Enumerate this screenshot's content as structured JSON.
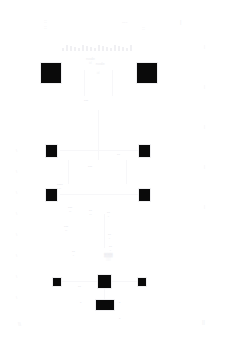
{
  "document": {
    "title": "Node Diagram",
    "background_color": "#ffffff",
    "node_color": "#0a0a0a",
    "faint_text_color": "#f0f0f3",
    "width": 246,
    "height": 340
  },
  "header": {
    "top_left_mark": "::\n::",
    "top_mid_mark": "---",
    "top_right_mark": "::",
    "far_right_mark": "|",
    "tick_count": 18,
    "caption": "node",
    "caption_sub": "id"
  },
  "rails": {
    "left_marks": [
      "\\",
      "\\",
      "\\",
      "\\",
      "\\",
      "\\",
      "\\",
      "\\"
    ],
    "right_marks": [
      "|",
      "|",
      "|",
      "|",
      "|"
    ]
  },
  "nodes": [
    {
      "id": "n1",
      "label": "",
      "sublabel": "",
      "x": 40,
      "y": 62,
      "w": 20,
      "h": 20,
      "size": "lg"
    },
    {
      "id": "n2",
      "label": "",
      "sublabel": "",
      "x": 136,
      "y": 62,
      "w": 20,
      "h": 20,
      "size": "lg"
    },
    {
      "id": "n3",
      "label": "",
      "sublabel": "",
      "x": 45,
      "y": 144,
      "w": 11,
      "h": 12,
      "size": "md"
    },
    {
      "id": "n4",
      "label": "",
      "sublabel": "",
      "x": 138,
      "y": 144,
      "w": 11,
      "h": 12,
      "size": "md"
    },
    {
      "id": "n5",
      "label": "",
      "sublabel": "",
      "x": 45,
      "y": 188,
      "w": 11,
      "h": 12,
      "size": "md"
    },
    {
      "id": "n6",
      "label": "",
      "sublabel": "",
      "x": 138,
      "y": 188,
      "w": 11,
      "h": 12,
      "size": "md"
    },
    {
      "id": "n7",
      "label": "",
      "sublabel": "",
      "x": 52,
      "y": 277,
      "w": 8,
      "h": 8,
      "size": "sm"
    },
    {
      "id": "n8",
      "label": "",
      "sublabel": "",
      "x": 97,
      "y": 274,
      "w": 13,
      "h": 13,
      "size": "md"
    },
    {
      "id": "n9",
      "label": "",
      "sublabel": "",
      "x": 137,
      "y": 277,
      "w": 8,
      "h": 8,
      "size": "sm"
    },
    {
      "id": "n10",
      "label": "",
      "sublabel": "",
      "x": 95,
      "y": 299,
      "w": 18,
      "h": 10,
      "size": "wide"
    }
  ],
  "labels": [
    {
      "id": "l_top",
      "text": "node",
      "sub": "id",
      "x": 86,
      "y": 56
    },
    {
      "id": "l_c1",
      "text": "•••",
      "sub": "",
      "x": 84,
      "y": 98
    },
    {
      "id": "l_c2",
      "text": "•••",
      "sub": "",
      "x": 88,
      "y": 164
    },
    {
      "id": "l_c3",
      "text": "••",
      "sub": "",
      "x": 117,
      "y": 152
    },
    {
      "id": "l_l1",
      "text": "••••",
      "sub": "••",
      "x": 57,
      "y": 182
    },
    {
      "id": "l_l2",
      "text": "•••",
      "sub": "••",
      "x": 68,
      "y": 205
    },
    {
      "id": "l_l3",
      "text": "•••",
      "sub": "••",
      "x": 64,
      "y": 224
    },
    {
      "id": "l_m1",
      "text": "••",
      "sub": "••",
      "x": 89,
      "y": 208
    },
    {
      "id": "l_m2",
      "text": "••",
      "sub": "•",
      "x": 107,
      "y": 210
    },
    {
      "id": "l_b1",
      "text": "••",
      "sub": "•",
      "x": 108,
      "y": 232
    },
    {
      "id": "l_b2",
      "text": "••",
      "sub": "•",
      "x": 109,
      "y": 244
    },
    {
      "id": "l_b3",
      "text": "••",
      "sub": "•",
      "x": 72,
      "y": 249
    },
    {
      "id": "l_b4",
      "text": "••",
      "sub": "",
      "x": 78,
      "y": 284
    },
    {
      "id": "l_b5",
      "text": "•",
      "sub": "",
      "x": 119,
      "y": 300
    },
    {
      "id": "l_b6",
      "text": "•",
      "sub": "",
      "x": 80,
      "y": 300
    },
    {
      "id": "l_b7",
      "text": "•",
      "sub": "",
      "x": 119,
      "y": 316
    },
    {
      "id": "l_cluster",
      "text": "▓▓▓",
      "sub": "▒▒",
      "x": 104,
      "y": 252
    }
  ],
  "edges": [
    {
      "id": "e1",
      "orient": "v",
      "x": 84,
      "y": 70,
      "len": 26
    },
    {
      "id": "e2",
      "orient": "v",
      "x": 112,
      "y": 70,
      "len": 26
    },
    {
      "id": "e3",
      "orient": "v",
      "x": 98,
      "y": 110,
      "len": 50
    },
    {
      "id": "e4",
      "orient": "v",
      "x": 68,
      "y": 160,
      "len": 24
    },
    {
      "id": "e5",
      "orient": "v",
      "x": 126,
      "y": 160,
      "len": 24
    },
    {
      "id": "e6",
      "orient": "v",
      "x": 104,
      "y": 214,
      "len": 34
    },
    {
      "id": "e7",
      "orient": "h",
      "x": 60,
      "y": 150,
      "len": 78
    },
    {
      "id": "e8",
      "orient": "h",
      "x": 60,
      "y": 194,
      "len": 78
    },
    {
      "id": "e9",
      "orient": "h",
      "x": 62,
      "y": 281,
      "len": 75
    },
    {
      "id": "e10",
      "orient": "v",
      "x": 104,
      "y": 287,
      "len": 12
    }
  ],
  "footer": {
    "mark_left": "\\\\",
    "mark_right": "||"
  }
}
